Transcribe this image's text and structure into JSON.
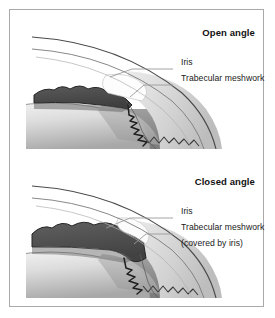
{
  "figure": {
    "panels": [
      {
        "id": "open-angle",
        "title": "Open angle",
        "labels": {
          "iris": "Iris",
          "trabecular_meshwork": "Trabecular meshwork",
          "trabecular_meshwork_sub": ""
        }
      },
      {
        "id": "closed-angle",
        "title": "Closed angle",
        "labels": {
          "iris": "Iris",
          "trabecular_meshwork": "Trabecular meshwork",
          "trabecular_meshwork_sub": "(covered by iris)"
        }
      }
    ]
  },
  "colors": {
    "frame_border": "#a9a9a9",
    "background": "#ffffff",
    "iris_dark": "#4f4f4f",
    "iris_outline": "#2b2b2b",
    "lens_light": "#f2f2f2",
    "lens_mid": "#b4b4b4",
    "vitreous_dark": "#8e8e8e",
    "sclera_light": "#e9e9e9",
    "sclera_mid": "#c9c9c9",
    "cornea_line": "#555555",
    "leader_line": "#9a9a9a",
    "text": "#1a1a1a"
  }
}
